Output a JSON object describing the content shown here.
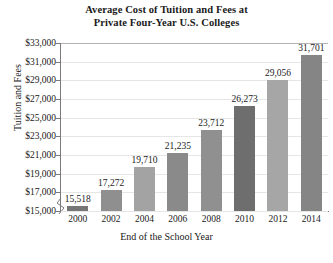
{
  "chart_data": {
    "type": "bar",
    "title": "Average Cost of Tuition and Fees at Private Four-Year U.S. Colleges",
    "title_line1": "Average Cost of Tuition and Fees at",
    "title_line2": "Private Four-Year U.S. Colleges",
    "xlabel": "End of the School Year",
    "ylabel": "Tuition and Fees",
    "categories": [
      "2000",
      "2002",
      "2004",
      "2006",
      "2008",
      "2010",
      "2012",
      "2014"
    ],
    "values": [
      15518,
      17272,
      19710,
      21235,
      23712,
      26273,
      29056,
      31701
    ],
    "value_labels": [
      "15,518",
      "17,272",
      "19,710",
      "21,235",
      "23,712",
      "26,273",
      "29,056",
      "31,701"
    ],
    "ylim": [
      15000,
      33000
    ],
    "ytick_values": [
      33000,
      31000,
      29000,
      27000,
      25000,
      23000,
      21000,
      19000,
      17000,
      15000
    ],
    "ytick_labels": [
      "$33,000",
      "$31,000",
      "$29,000",
      "$27,000",
      "$25,000",
      "$23,000",
      "$21,000",
      "$19,000",
      "$17,000",
      "$15,000"
    ],
    "grid": true,
    "legend": "none",
    "axis_break": true,
    "bar_colors": [
      "#767676",
      "#8f8f8f",
      "#a3a3a3",
      "#8a8a8a",
      "#909090",
      "#6e6e6e",
      "#a6a6a6",
      "#858585"
    ],
    "colors": {
      "background": "#ffffff",
      "gridline": "#e6e6e6",
      "axis": "#7a7a7a",
      "text": "#1a1a1a"
    }
  }
}
